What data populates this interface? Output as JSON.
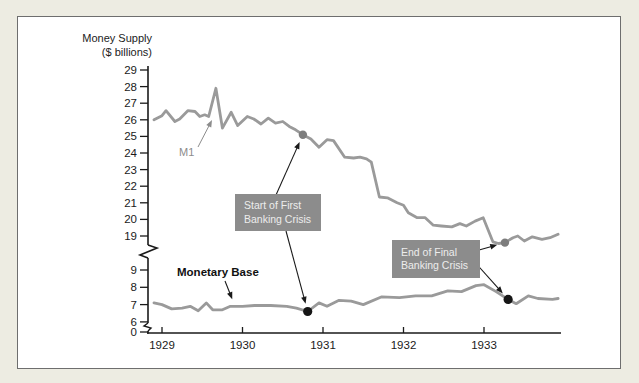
{
  "title": {
    "line1": "Money Supply",
    "line2": "($ billions)"
  },
  "labels": {
    "m1": "M1",
    "monetary_base": "Monetary Base",
    "start_crisis": {
      "line1": "Start of First",
      "line2": "Banking Crisis"
    },
    "end_crisis": {
      "line1": "End of Final",
      "line2": "Banking Crisis"
    }
  },
  "colors": {
    "background": "#edece2",
    "panel": "#ffffff",
    "panel_border": "#6e6e6e",
    "line_gray": "#9a9a9a",
    "axis_black": "#1a1a1a",
    "annotation_box": "#8c8c8c",
    "annotation_text": "#ededed",
    "dot_gray": "#7d7d7d",
    "dot_black": "#161616",
    "m1_label_gray": "#8c8c8c"
  },
  "chart_data": {
    "type": "line",
    "title": "Money Supply ($ billions)",
    "ylabel": "Money Supply ($ billions)",
    "x_axis": {
      "ticks": [
        1929,
        1930,
        1931,
        1932,
        1933
      ],
      "range": [
        1928.9,
        1934
      ]
    },
    "y_axis": {
      "upper_ticks": [
        29,
        28,
        27,
        26,
        25,
        24,
        23,
        22,
        21,
        20,
        19
      ],
      "lower_ticks": [
        9,
        8,
        7,
        6,
        0
      ],
      "break_between": [
        9,
        19
      ],
      "units": "$ billions"
    },
    "legend_position": "inline-labels",
    "grid": false,
    "series": [
      {
        "name": "M1",
        "points": [
          [
            1928.9,
            26.0
          ],
          [
            1929.0,
            26.25
          ],
          [
            1929.05,
            26.55
          ],
          [
            1929.16,
            25.9
          ],
          [
            1929.22,
            26.05
          ],
          [
            1929.32,
            26.55
          ],
          [
            1929.41,
            26.5
          ],
          [
            1929.47,
            26.2
          ],
          [
            1929.53,
            26.3
          ],
          [
            1929.58,
            26.2
          ],
          [
            1929.67,
            27.9
          ],
          [
            1929.75,
            25.5
          ],
          [
            1929.86,
            26.45
          ],
          [
            1929.94,
            25.65
          ],
          [
            1930.06,
            26.2
          ],
          [
            1930.14,
            26.05
          ],
          [
            1930.23,
            25.75
          ],
          [
            1930.32,
            26.1
          ],
          [
            1930.41,
            25.8
          ],
          [
            1930.5,
            25.9
          ],
          [
            1930.58,
            25.6
          ],
          [
            1930.66,
            25.4
          ],
          [
            1930.75,
            25.1
          ],
          [
            1930.85,
            24.85
          ],
          [
            1930.95,
            24.35
          ],
          [
            1931.05,
            24.8
          ],
          [
            1931.13,
            24.75
          ],
          [
            1931.27,
            23.75
          ],
          [
            1931.38,
            23.7
          ],
          [
            1931.46,
            23.75
          ],
          [
            1931.54,
            23.65
          ],
          [
            1931.6,
            23.45
          ],
          [
            1931.7,
            21.35
          ],
          [
            1931.8,
            21.3
          ],
          [
            1931.92,
            21.0
          ],
          [
            1932.0,
            20.85
          ],
          [
            1932.06,
            20.4
          ],
          [
            1932.17,
            20.1
          ],
          [
            1932.27,
            20.1
          ],
          [
            1932.37,
            19.65
          ],
          [
            1932.47,
            19.6
          ],
          [
            1932.6,
            19.55
          ],
          [
            1932.7,
            19.75
          ],
          [
            1932.78,
            19.6
          ],
          [
            1932.89,
            19.9
          ],
          [
            1932.99,
            20.1
          ],
          [
            1933.11,
            18.65
          ],
          [
            1933.18,
            18.55
          ],
          [
            1933.26,
            18.6
          ],
          [
            1933.36,
            18.9
          ],
          [
            1933.42,
            19.0
          ],
          [
            1933.5,
            18.7
          ],
          [
            1933.6,
            18.95
          ],
          [
            1933.72,
            18.8
          ],
          [
            1933.82,
            18.9
          ],
          [
            1933.92,
            19.1
          ]
        ]
      },
      {
        "name": "Monetary Base",
        "points": [
          [
            1928.9,
            7.1
          ],
          [
            1929.0,
            7.0
          ],
          [
            1929.12,
            6.75
          ],
          [
            1929.25,
            6.8
          ],
          [
            1929.35,
            6.9
          ],
          [
            1929.45,
            6.65
          ],
          [
            1929.55,
            7.1
          ],
          [
            1929.63,
            6.7
          ],
          [
            1929.75,
            6.7
          ],
          [
            1929.85,
            6.9
          ],
          [
            1930.0,
            6.9
          ],
          [
            1930.15,
            6.95
          ],
          [
            1930.35,
            6.95
          ],
          [
            1930.55,
            6.9
          ],
          [
            1930.67,
            6.8
          ],
          [
            1930.81,
            6.6
          ],
          [
            1930.95,
            7.1
          ],
          [
            1931.05,
            6.9
          ],
          [
            1931.2,
            7.25
          ],
          [
            1931.35,
            7.2
          ],
          [
            1931.5,
            7.0
          ],
          [
            1931.73,
            7.45
          ],
          [
            1931.95,
            7.4
          ],
          [
            1932.15,
            7.5
          ],
          [
            1932.35,
            7.5
          ],
          [
            1932.55,
            7.8
          ],
          [
            1932.72,
            7.75
          ],
          [
            1932.9,
            8.1
          ],
          [
            1933.0,
            8.15
          ],
          [
            1933.15,
            7.75
          ],
          [
            1933.3,
            7.3
          ],
          [
            1933.4,
            7.05
          ],
          [
            1933.55,
            7.5
          ],
          [
            1933.67,
            7.35
          ],
          [
            1933.85,
            7.3
          ],
          [
            1933.92,
            7.35
          ]
        ]
      }
    ],
    "annotations": [
      {
        "label": "Start of First Banking Crisis",
        "markers": [
          {
            "series": "M1",
            "x": 1930.75,
            "y": 25.1,
            "style": "gray"
          },
          {
            "series": "Monetary Base",
            "x": 1930.81,
            "y": 6.6,
            "style": "black"
          }
        ]
      },
      {
        "label": "End of Final Banking Crisis",
        "markers": [
          {
            "series": "M1",
            "x": 1933.26,
            "y": 18.6,
            "style": "gray"
          },
          {
            "series": "Monetary Base",
            "x": 1933.3,
            "y": 7.3,
            "style": "black"
          }
        ]
      }
    ]
  }
}
